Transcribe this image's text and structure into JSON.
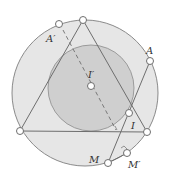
{
  "diagram": {
    "colors": {
      "outer_fill": "#e6e6e6",
      "outer_stroke": "#8a8a8a",
      "incircle_fill": "#cfcfcf",
      "line": "#6e6e6e",
      "point_fill": "#ffffff",
      "point_stroke": "#6e6e6e"
    },
    "outer_circle": {
      "cx": 85,
      "cy": 93,
      "r": 73
    },
    "incircle": {
      "cx": 91,
      "cy": 88,
      "r": 43
    },
    "triangle": {
      "top": [
        83,
        20
      ],
      "left": [
        20,
        131
      ],
      "right": [
        147,
        132
      ]
    },
    "points": [
      {
        "name": "top-vertex",
        "x": 83,
        "y": 20
      },
      {
        "name": "left-vertex",
        "x": 20,
        "y": 131
      },
      {
        "name": "right-vertex",
        "x": 147,
        "y": 132
      },
      {
        "name": "A-prime",
        "x": 59,
        "y": 24
      },
      {
        "name": "A",
        "x": 150,
        "y": 61
      },
      {
        "name": "I-prime",
        "x": 91,
        "y": 86
      },
      {
        "name": "I",
        "x": 129,
        "y": 113
      },
      {
        "name": "M",
        "x": 108,
        "y": 163
      },
      {
        "name": "M-prime",
        "x": 127,
        "y": 153
      }
    ],
    "labels": {
      "A_prime": "A′",
      "A": "A",
      "I_prime": "I′",
      "I": "I",
      "M": "M",
      "M_prime": "M′"
    }
  }
}
